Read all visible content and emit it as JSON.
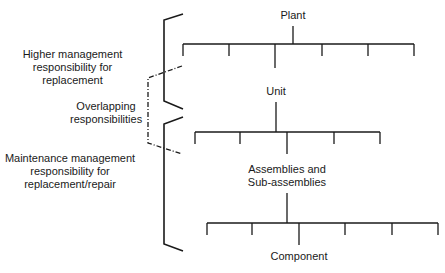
{
  "diagram": {
    "type": "hierarchy",
    "nodes": {
      "plant": "Plant",
      "unit": "Unit",
      "assemblies_line1": "Assemblies and",
      "assemblies_line2": "Sub-assemblies",
      "component": "Component"
    },
    "responsibilities": {
      "higher": {
        "line1": "Higher management",
        "line2": "responsibility for",
        "line3": "replacement"
      },
      "overlap": {
        "line1": "Overlapping",
        "line2": "responsibilities"
      },
      "maintenance": {
        "line1": "Maintenance management",
        "line2": "responsibility for",
        "line3": "replacement/repair"
      }
    },
    "colors": {
      "line": "#1a1a1a",
      "background": "#ffffff"
    }
  }
}
